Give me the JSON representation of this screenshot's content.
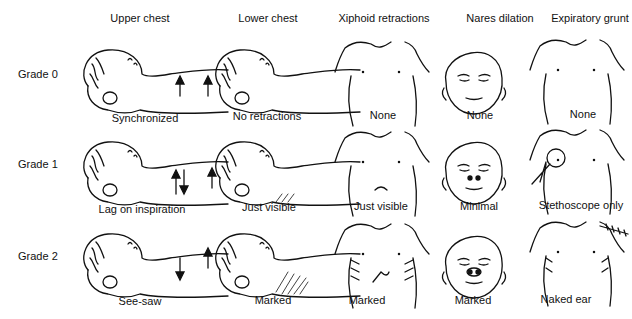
{
  "columns": [
    {
      "label": "Upper chest"
    },
    {
      "label": "Lower chest"
    },
    {
      "label": "Xiphoid retractions"
    },
    {
      "label": "Nares dilation"
    },
    {
      "label": "Expiratory grunt"
    }
  ],
  "rows": [
    {
      "grade": "Grade 0",
      "captions": [
        "Synchronized",
        "No retractions",
        "None",
        "None",
        "None"
      ]
    },
    {
      "grade": "Grade 1",
      "captions": [
        "Lag on inspiration",
        "Just visible",
        "Just visible",
        "Minimal",
        "Stethoscope only"
      ]
    },
    {
      "grade": "Grade 2",
      "captions": [
        "See-saw",
        "Marked",
        "Marked",
        "Marked",
        "Naked ear"
      ]
    }
  ],
  "icons": {
    "arrow_up": "arrow-up-icon",
    "arrow_down": "arrow-down-icon",
    "stethoscope": "stethoscope-icon",
    "ear": "ear-icon"
  }
}
